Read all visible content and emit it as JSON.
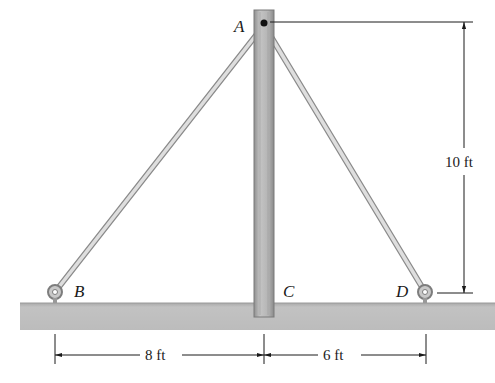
{
  "diagram": {
    "type": "statics-pole-with-guy-wires",
    "points": {
      "A": "A",
      "B": "B",
      "C": "C",
      "D": "D"
    },
    "dimensions": {
      "bc": "8 ft",
      "cd": "6 ft",
      "height": "10 ft"
    },
    "colors": {
      "ground": "#bdbdbd",
      "pole": "#b0b0b0",
      "wire": "#cfcfcf",
      "line": "#1a1a1a"
    }
  }
}
